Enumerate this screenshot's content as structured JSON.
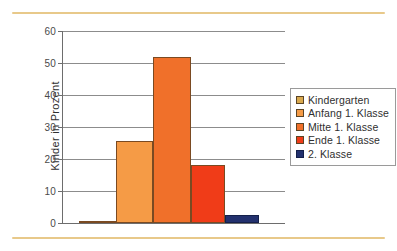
{
  "chart_data": {
    "type": "bar",
    "title": "",
    "subtitle": "",
    "xlabel": "",
    "ylabel": "Kinder in Prozent",
    "ylim": [
      0,
      60
    ],
    "ytick_step": 10,
    "ytick_labels": [
      "0",
      "10",
      "20",
      "30",
      "40",
      "50",
      "60"
    ],
    "ytick_values": [
      0,
      10,
      20,
      30,
      40,
      50,
      60
    ],
    "grid": "horizontal",
    "legend_position": "right",
    "categories": [
      "Kindergarten",
      "Anfang 1. Klasse",
      "Mitte 1. Klasse",
      "Ende 1. Klasse",
      "2. Klasse"
    ],
    "values": [
      0.7,
      25.6,
      52,
      18,
      2.5
    ],
    "series": [
      {
        "name": "Kinder in Prozent",
        "values": [
          0.7,
          25.6,
          52,
          18,
          2.5
        ]
      }
    ],
    "bar_colors": [
      "#D9A94E",
      "#F59B46",
      "#F0702A",
      "#F03C18",
      "#23316E"
    ],
    "x_tick_labels": [
      "",
      "",
      "",
      "",
      ""
    ],
    "annotations": []
  },
  "legend": {
    "items": [
      {
        "label": "Kindergarten",
        "color": "#D9A94E",
        "swatch_class": ""
      },
      {
        "label": "Anfang 1. Klasse",
        "color": "#F59B46",
        "swatch_class": ""
      },
      {
        "label": "Mitte 1. Klasse",
        "color": "#F0702A",
        "swatch_class": ""
      },
      {
        "label": "Ende 1. Klasse",
        "color": "#F03C18",
        "swatch_class": ""
      },
      {
        "label": "2. Klasse",
        "color": "#23316E",
        "swatch_class": "navy"
      }
    ]
  },
  "decoration": {
    "rule_color": "#E8C98A"
  },
  "axis": {
    "line_color": "#6D6D6D",
    "grid_color": "#8C8C8C"
  }
}
